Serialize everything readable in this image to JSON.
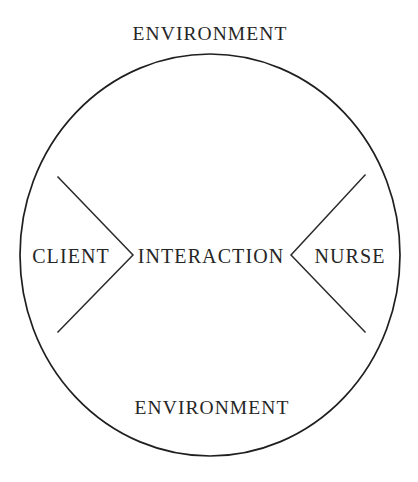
{
  "diagram": {
    "title_top": "ENVIRONMENT",
    "title_bottom": "ENVIRONMENT",
    "nodes": {
      "left": "CLIENT",
      "center": "INTERACTION",
      "right": "NURSE"
    },
    "colors": {
      "background": "#ffffff",
      "stroke": "#1f1f1f",
      "text": "#262626"
    },
    "geometry": {
      "circle_center_x": 210,
      "circle_center_y": 255,
      "circle_radius_x": 190,
      "circle_radius_y": 201,
      "stroke_width": 1.6
    }
  }
}
